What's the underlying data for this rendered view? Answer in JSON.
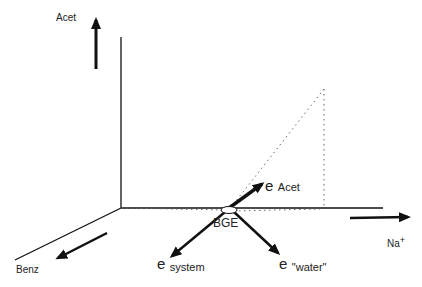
{
  "diagram": {
    "type": "3D vector diagram",
    "axes": {
      "vertical": {
        "label": "Acet"
      },
      "horizontal": {
        "label": "Na",
        "superscript": "+"
      },
      "depth": {
        "label": "Benz"
      }
    },
    "origin_point": {
      "label": "BGE"
    },
    "vectors": [
      {
        "symbol": "e",
        "subscript": "Acet"
      },
      {
        "symbol": "e",
        "subscript": "system"
      },
      {
        "symbol": "e",
        "subscript": "\"water\""
      }
    ],
    "colors": {
      "ink": "#111111",
      "dotted": "#666666"
    }
  }
}
